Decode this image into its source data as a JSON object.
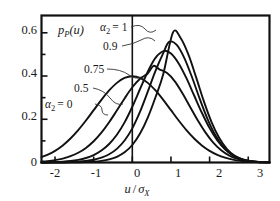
{
  "chart_data": {
    "type": "line",
    "title": "",
    "xlabel": "u / σX",
    "ylabel": "pP(u)",
    "xlim": [
      -2.35,
      3.55
    ],
    "ylim": [
      0,
      0.68
    ],
    "grid": false,
    "legend_position": "inline-annotations",
    "xticks": [
      -2,
      -1,
      0,
      1,
      2,
      3
    ],
    "xtick_labels": [
      "-2",
      "-1",
      "0",
      "1",
      "2",
      "3"
    ],
    "yticks": [
      0,
      0.2,
      0.4,
      0.6
    ],
    "ytick_labels": [
      "0",
      "0.2",
      "0.4",
      "0.6"
    ],
    "minor_yticks": [
      0.1,
      0.3,
      0.5
    ],
    "vertical_reference_line_x": 0,
    "series": [
      {
        "name": "α2 = 0",
        "label": "α_2 = 0",
        "peak_x": 0.0,
        "peak_y": 0.399,
        "x": [
          -2.35,
          -2.2,
          -2.0,
          -1.8,
          -1.6,
          -1.4,
          -1.2,
          -1.0,
          -0.8,
          -0.6,
          -0.4,
          -0.2,
          0.0,
          0.2,
          0.4,
          0.6,
          0.8,
          1.0,
          1.2,
          1.4,
          1.6,
          1.8,
          2.0,
          2.2,
          2.4,
          2.6,
          2.8,
          3.0,
          3.2,
          3.4,
          3.55
        ],
        "y": [
          0.0252,
          0.0355,
          0.054,
          0.079,
          0.1109,
          0.1497,
          0.1942,
          0.242,
          0.2897,
          0.3332,
          0.3683,
          0.391,
          0.3989,
          0.391,
          0.3683,
          0.3332,
          0.2897,
          0.242,
          0.1942,
          0.1497,
          0.1109,
          0.079,
          0.054,
          0.0355,
          0.0224,
          0.0136,
          0.0079,
          0.0044,
          0.0024,
          0.0012,
          0.0007
        ]
      },
      {
        "name": "α2 = 0.5",
        "label": "0.5",
        "peak_x": 0.55,
        "peak_y": 0.447,
        "x": [
          -2.35,
          -2.2,
          -2.0,
          -1.8,
          -1.6,
          -1.4,
          -1.2,
          -1.0,
          -0.8,
          -0.6,
          -0.4,
          -0.2,
          0.0,
          0.2,
          0.4,
          0.55,
          0.7,
          0.9,
          1.1,
          1.3,
          1.5,
          1.7,
          1.9,
          2.1,
          2.3,
          2.5,
          2.7,
          2.9,
          3.1,
          3.3,
          3.55
        ],
        "y": [
          0.004,
          0.0062,
          0.0108,
          0.018,
          0.029,
          0.045,
          0.0676,
          0.0983,
          0.138,
          0.1862,
          0.2405,
          0.2965,
          0.348,
          0.3878,
          0.412,
          0.447,
          0.431,
          0.4135,
          0.3755,
          0.3195,
          0.256,
          0.193,
          0.137,
          0.091,
          0.0566,
          0.033,
          0.018,
          0.0093,
          0.0045,
          0.0021,
          0.0008
        ]
      },
      {
        "name": "α2 = 0.75",
        "label": "0.75",
        "peak_x": 0.82,
        "peak_y": 0.516,
        "x": [
          -2.35,
          -2.2,
          -2.0,
          -1.8,
          -1.6,
          -1.4,
          -1.2,
          -1.0,
          -0.8,
          -0.6,
          -0.4,
          -0.2,
          0.0,
          0.2,
          0.4,
          0.6,
          0.82,
          1.0,
          1.2,
          1.4,
          1.6,
          1.8,
          2.0,
          2.2,
          2.4,
          2.6,
          2.8,
          3.0,
          3.2,
          3.4,
          3.55
        ],
        "y": [
          0.0006,
          0.001,
          0.002,
          0.0038,
          0.0069,
          0.0122,
          0.0208,
          0.0344,
          0.0551,
          0.0854,
          0.1281,
          0.1855,
          0.258,
          0.34,
          0.42,
          0.484,
          0.516,
          0.504,
          0.458,
          0.39,
          0.31,
          0.23,
          0.159,
          0.102,
          0.061,
          0.034,
          0.0175,
          0.0085,
          0.0038,
          0.0016,
          0.0007
        ]
      },
      {
        "name": "α2 = 0.9",
        "label": "0.9",
        "peak_x": 0.95,
        "peak_y": 0.558,
        "x": [
          -2.35,
          -2.2,
          -2.0,
          -1.8,
          -1.6,
          -1.4,
          -1.2,
          -1.0,
          -0.8,
          -0.6,
          -0.4,
          -0.2,
          0.0,
          0.2,
          0.4,
          0.6,
          0.8,
          0.95,
          1.15,
          1.35,
          1.55,
          1.75,
          1.95,
          2.15,
          2.35,
          2.55,
          2.75,
          2.95,
          3.15,
          3.35,
          3.55
        ],
        "y": [
          0.0001,
          0.0002,
          0.0005,
          0.001,
          0.002,
          0.0038,
          0.007,
          0.0126,
          0.0222,
          0.038,
          0.0632,
          0.1018,
          0.158,
          0.235,
          0.328,
          0.424,
          0.506,
          0.558,
          0.544,
          0.482,
          0.392,
          0.292,
          0.2,
          0.126,
          0.073,
          0.039,
          0.0192,
          0.0087,
          0.0036,
          0.0014,
          0.0005
        ]
      },
      {
        "name": "α2 = 1",
        "label": "α_2 = 1",
        "peak_x": 1.05,
        "peak_y": 0.601,
        "x": [
          -2.35,
          -2.2,
          -2.0,
          -1.8,
          -1.6,
          -1.4,
          -1.2,
          -1.0,
          -0.8,
          -0.6,
          -0.4,
          -0.2,
          0.0,
          0.2,
          0.4,
          0.6,
          0.8,
          1.05,
          1.25,
          1.45,
          1.65,
          1.85,
          2.05,
          2.25,
          2.45,
          2.65,
          2.85,
          3.05,
          3.25,
          3.45,
          3.55
        ],
        "y": [
          0.0,
          0.0,
          0.0001,
          0.0002,
          0.0004,
          0.0009,
          0.0019,
          0.0038,
          0.0075,
          0.0143,
          0.0263,
          0.047,
          0.081,
          0.134,
          0.208,
          0.302,
          0.408,
          0.601,
          0.576,
          0.5,
          0.395,
          0.284,
          0.187,
          0.113,
          0.062,
          0.0312,
          0.0143,
          0.006,
          0.0023,
          0.0008,
          0.0004
        ]
      }
    ],
    "annotations": [
      {
        "text": "pP(u)",
        "role": "y-axis-inline-label"
      },
      {
        "text": "α2 = 1",
        "role": "curve-callout"
      },
      {
        "text": "0.9",
        "role": "curve-callout"
      },
      {
        "text": "0.75",
        "role": "curve-callout"
      },
      {
        "text": "0.5",
        "role": "curve-callout"
      },
      {
        "text": "α2 = 0",
        "role": "curve-callout"
      }
    ]
  },
  "labels": {
    "y_inline_p": "p",
    "y_inline_sub": "P",
    "y_inline_arg": "(u)",
    "x_axis_u": "u",
    "x_axis_slash": "/",
    "x_axis_sigma": "σ",
    "x_axis_sub": "X",
    "alpha": "α",
    "alpha_sub": "2",
    "eq_one": "= 1",
    "eq_zero": "= 0",
    "c_09": "0.9",
    "c_075": "0.75",
    "c_05": "0.5",
    "ytick_0": "0",
    "ytick_02": "0.2",
    "ytick_04": "0.4",
    "ytick_06": "0.6",
    "xtick_m2": "-2",
    "xtick_m1": "-1",
    "xtick_0": "0",
    "xtick_1": "1",
    "xtick_2": "2",
    "xtick_3": "3"
  },
  "colors": {
    "curve": "#111111",
    "axis": "#111111",
    "background": "#ffffff",
    "text": "#1a1a1a"
  }
}
